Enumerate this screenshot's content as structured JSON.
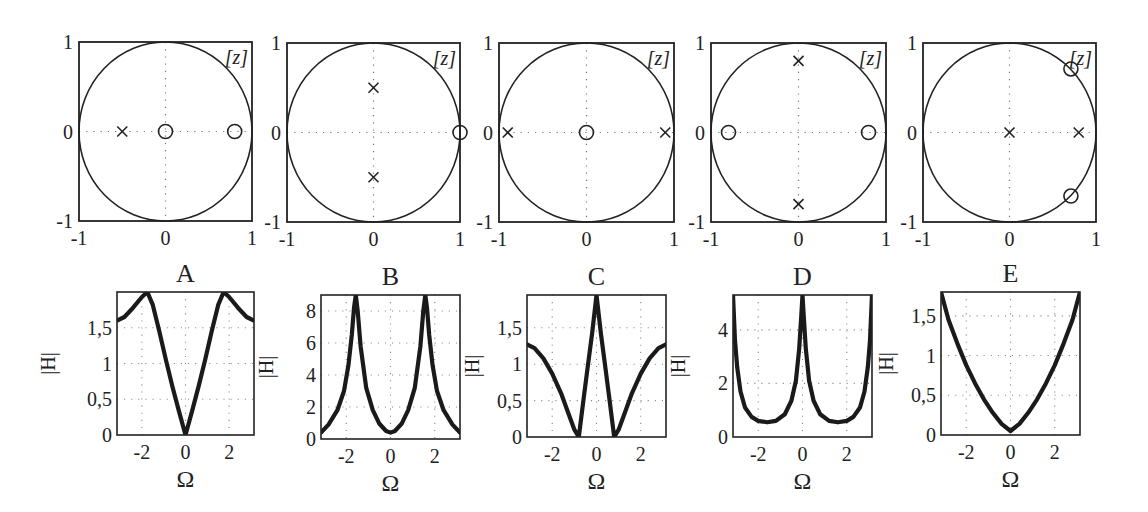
{
  "figure": {
    "panel_labels": [
      "A",
      "B",
      "C",
      "D",
      "E"
    ],
    "z_plane_label": "[z]",
    "xlabel": "Ω",
    "ylabel": "|H|"
  },
  "chart_data": [
    {
      "type": "scatter",
      "panel": "A",
      "title": "pole-zero plot A",
      "xlim": [
        -1,
        1
      ],
      "ylim": [
        -1,
        1
      ],
      "xticks": [
        "-1",
        "0",
        "1"
      ],
      "yticks": [
        "-1",
        "0",
        "1"
      ],
      "unit_circle": true,
      "annotation": "[z]",
      "zeros": [
        [
          0,
          0
        ],
        [
          0.8,
          0
        ]
      ],
      "poles": [
        [
          -0.5,
          0
        ]
      ]
    },
    {
      "type": "scatter",
      "panel": "B",
      "title": "pole-zero plot B",
      "xlim": [
        -1,
        1
      ],
      "ylim": [
        -1,
        1
      ],
      "xticks": [
        "-1",
        "0",
        "1"
      ],
      "yticks": [
        "-1",
        "0",
        "1"
      ],
      "unit_circle": true,
      "annotation": "[z]",
      "zeros": [
        [
          1,
          0
        ]
      ],
      "poles": [
        [
          0,
          0.5
        ],
        [
          0,
          -0.5
        ]
      ]
    },
    {
      "type": "scatter",
      "panel": "C",
      "title": "pole-zero plot C",
      "xlim": [
        -1,
        1
      ],
      "ylim": [
        -1,
        1
      ],
      "xticks": [
        "-1",
        "0",
        "1"
      ],
      "yticks": [
        "-1",
        "0",
        "1"
      ],
      "unit_circle": true,
      "annotation": "[z]",
      "zeros": [
        [
          0,
          0
        ]
      ],
      "poles": [
        [
          -0.9,
          0
        ],
        [
          0.9,
          0
        ]
      ]
    },
    {
      "type": "scatter",
      "panel": "D",
      "title": "pole-zero plot D",
      "xlim": [
        -1,
        1
      ],
      "ylim": [
        -1,
        1
      ],
      "xticks": [
        "-1",
        "0",
        "1"
      ],
      "yticks": [
        "-1",
        "0",
        "1"
      ],
      "unit_circle": true,
      "annotation": "[z]",
      "zeros": [
        [
          -0.8,
          0
        ],
        [
          0.8,
          0
        ]
      ],
      "poles": [
        [
          0,
          0.8
        ],
        [
          0,
          -0.8
        ]
      ]
    },
    {
      "type": "scatter",
      "panel": "E",
      "title": "pole-zero plot E",
      "xlim": [
        -1,
        1
      ],
      "ylim": [
        -1,
        1
      ],
      "xticks": [
        "-1",
        "0",
        "1"
      ],
      "yticks": [
        "-1",
        "0",
        "1"
      ],
      "unit_circle": true,
      "annotation": "[z]",
      "zeros": [
        [
          0.71,
          0.71
        ],
        [
          0.71,
          -0.71
        ]
      ],
      "poles": [
        [
          0,
          0
        ],
        [
          0.8,
          0
        ]
      ]
    },
    {
      "type": "line",
      "panel": "A",
      "title": "A",
      "xlabel": "Ω",
      "ylabel": "|H|",
      "xlim": [
        -3.14,
        3.14
      ],
      "ylim": [
        0,
        2.0
      ],
      "xticks": [
        "-2",
        "0",
        "2"
      ],
      "yticks": [
        "0",
        "0,5",
        "1",
        "1,5"
      ],
      "grid": true,
      "x": [
        -3.14,
        -2.8,
        -2.4,
        -2.0,
        -1.75,
        -1.5,
        -1.2,
        -0.9,
        -0.6,
        -0.3,
        0,
        0.3,
        0.6,
        0.9,
        1.2,
        1.5,
        1.75,
        2.0,
        2.4,
        2.8,
        3.14
      ],
      "values": [
        1.6,
        1.65,
        1.78,
        1.93,
        2.0,
        1.82,
        1.45,
        1.05,
        0.68,
        0.33,
        0.0,
        0.33,
        0.68,
        1.05,
        1.45,
        1.82,
        2.0,
        1.93,
        1.78,
        1.65,
        1.6
      ]
    },
    {
      "type": "line",
      "panel": "B",
      "title": "B",
      "xlabel": "Ω",
      "ylabel": "|H|",
      "xlim": [
        -3.14,
        3.14
      ],
      "ylim": [
        0,
        9.0
      ],
      "xticks": [
        "-2",
        "0",
        "2"
      ],
      "yticks": [
        "0",
        "2",
        "4",
        "6",
        "8"
      ],
      "grid": true,
      "x": [
        -3.14,
        -2.8,
        -2.4,
        -2.1,
        -1.9,
        -1.75,
        -1.65,
        -1.57,
        -1.48,
        -1.35,
        -1.1,
        -0.8,
        -0.5,
        -0.2,
        0,
        0.2,
        0.5,
        0.8,
        1.1,
        1.35,
        1.48,
        1.57,
        1.65,
        1.75,
        1.9,
        2.1,
        2.4,
        2.8,
        3.14
      ],
      "values": [
        0.4,
        0.9,
        1.8,
        3.0,
        4.6,
        6.5,
        8.2,
        9.0,
        8.0,
        5.8,
        3.2,
        1.8,
        0.95,
        0.5,
        0.4,
        0.5,
        0.95,
        1.8,
        3.2,
        5.8,
        8.0,
        9.0,
        8.2,
        6.5,
        4.6,
        3.0,
        1.8,
        0.9,
        0.4
      ]
    },
    {
      "type": "line",
      "panel": "C",
      "title": "C",
      "xlabel": "Ω",
      "ylabel": "|H|",
      "xlim": [
        -3.14,
        3.14
      ],
      "ylim": [
        0,
        1.95
      ],
      "xticks": [
        "-2",
        "0",
        "2"
      ],
      "yticks": [
        "0",
        "0,5",
        "1",
        "1,5"
      ],
      "grid": true,
      "x": [
        -3.14,
        -2.8,
        -2.4,
        -2.0,
        -1.6,
        -1.3,
        -1.0,
        -0.8,
        -0.6,
        -0.4,
        -0.2,
        0,
        0.2,
        0.4,
        0.6,
        0.8,
        1.0,
        1.3,
        1.6,
        2.0,
        2.4,
        2.8,
        3.14
      ],
      "values": [
        1.27,
        1.22,
        1.08,
        0.87,
        0.6,
        0.35,
        0.1,
        0.0,
        0.48,
        0.95,
        1.42,
        1.95,
        1.42,
        0.95,
        0.48,
        0.0,
        0.1,
        0.35,
        0.6,
        0.87,
        1.08,
        1.22,
        1.27
      ]
    },
    {
      "type": "line",
      "panel": "D",
      "title": "D",
      "xlabel": "Ω",
      "ylabel": "|H|",
      "xlim": [
        -3.14,
        3.14
      ],
      "ylim": [
        0,
        5.3
      ],
      "xticks": [
        "-2",
        "0",
        "2"
      ],
      "yticks": [
        "0",
        "2",
        "4"
      ],
      "grid": true,
      "x": [
        -3.14,
        -3.05,
        -2.95,
        -2.8,
        -2.6,
        -2.3,
        -2.0,
        -1.6,
        -1.2,
        -0.8,
        -0.5,
        -0.3,
        -0.15,
        -0.05,
        0,
        0.05,
        0.15,
        0.3,
        0.5,
        0.8,
        1.2,
        1.6,
        2.0,
        2.3,
        2.6,
        2.8,
        2.95,
        3.05,
        3.14
      ],
      "values": [
        5.3,
        3.6,
        2.6,
        1.7,
        1.1,
        0.75,
        0.6,
        0.55,
        0.6,
        0.85,
        1.35,
        2.1,
        3.3,
        4.6,
        5.3,
        4.6,
        3.3,
        2.1,
        1.35,
        0.85,
        0.6,
        0.55,
        0.6,
        0.75,
        1.1,
        1.7,
        2.6,
        3.6,
        5.3
      ]
    },
    {
      "type": "line",
      "panel": "E",
      "title": "E",
      "xlabel": "Ω",
      "ylabel": "|H|",
      "xlim": [
        -3.14,
        3.14
      ],
      "ylim": [
        0,
        1.8
      ],
      "xticks": [
        "-2",
        "0",
        "2"
      ],
      "yticks": [
        "0",
        "0,5",
        "1",
        "1,5"
      ],
      "grid": true,
      "x": [
        -3.14,
        -2.8,
        -2.4,
        -2.0,
        -1.6,
        -1.2,
        -0.8,
        -0.4,
        0,
        0.4,
        0.8,
        1.2,
        1.6,
        2.0,
        2.4,
        2.8,
        3.14
      ],
      "values": [
        1.8,
        1.45,
        1.15,
        0.88,
        0.65,
        0.45,
        0.28,
        0.14,
        0.05,
        0.14,
        0.28,
        0.45,
        0.65,
        0.88,
        1.15,
        1.45,
        1.8
      ]
    }
  ],
  "layout": {
    "top": [
      {
        "left": 79,
        "top": 42,
        "w": 173,
        "h": 179
      },
      {
        "left": 287,
        "top": 43,
        "w": 173,
        "h": 179
      },
      {
        "left": 499,
        "top": 43,
        "w": 175,
        "h": 179
      },
      {
        "left": 711,
        "top": 43,
        "w": 175,
        "h": 179
      },
      {
        "left": 923,
        "top": 43,
        "w": 173,
        "h": 179
      }
    ],
    "bottom": [
      {
        "left": 117,
        "top": 292,
        "w": 137,
        "h": 143
      },
      {
        "left": 321,
        "top": 295,
        "w": 139,
        "h": 144
      },
      {
        "left": 527,
        "top": 295,
        "w": 139,
        "h": 142
      },
      {
        "left": 733,
        "top": 295,
        "w": 139,
        "h": 142
      },
      {
        "left": 941,
        "top": 292,
        "w": 139,
        "h": 143
      }
    ]
  }
}
